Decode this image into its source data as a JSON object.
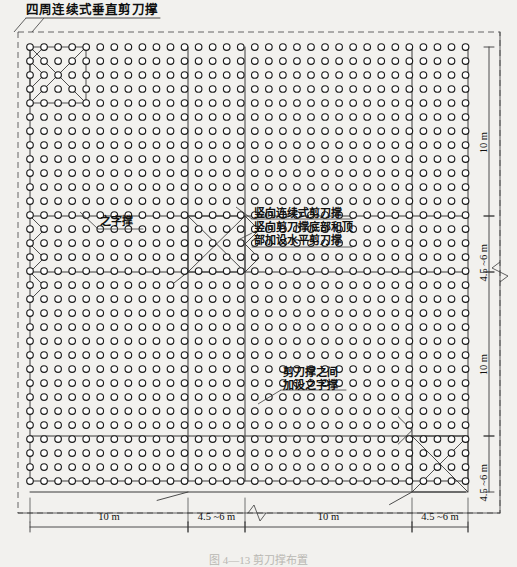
{
  "figure": {
    "title_callout": "四周连续式垂直剪刀撑",
    "caption": "图 4—13  剪刀撑布置",
    "annotations": [
      {
        "name": "zigzag-brace",
        "text": "之字撑"
      },
      {
        "name": "vertical-continuous-brace",
        "text": "竖向连续式剪刀撑"
      },
      {
        "name": "vertical-brace-top-bottom",
        "text": "竖向剪刀撑底部和顶"
      },
      {
        "name": "horizontal-brace-added",
        "text": "部加设水平剪刀撑"
      },
      {
        "name": "between-braces",
        "text": "剪刀撑之间"
      },
      {
        "name": "add-zigzag",
        "text": "加设之字撑"
      }
    ]
  },
  "dimensions": {
    "bottom": [
      {
        "label": "10 m",
        "x0": 30,
        "x1": 188
      },
      {
        "label": "4.5 ~6 m",
        "x0": 188,
        "x1": 245
      },
      {
        "label": "10 m",
        "x0": 245,
        "x1": 412
      },
      {
        "label": "4.5 ~6 m",
        "x0": 412,
        "x1": 468
      }
    ],
    "right": [
      {
        "label": "10 m",
        "y0": 47,
        "y1": 216
      },
      {
        "label": "4.5 ~6 m",
        "y0": 216,
        "y1": 272
      },
      {
        "label": "10 m",
        "y0": 272,
        "y1": 436
      },
      {
        "label": "4.5 ~6 m",
        "y0": 436,
        "y1": 492
      }
    ]
  },
  "chart_data": {
    "type": "diagram",
    "grid": {
      "x_start": 30,
      "y_start": 47,
      "pitch_x": 14.05,
      "pitch_y": 14.0,
      "cols": 32,
      "rows": 32,
      "dot_radius": 3.3
    },
    "bay_lines": {
      "vertical_x": [
        188,
        245,
        412,
        468
      ],
      "horizontal_y": [
        216,
        272,
        436,
        492
      ]
    },
    "border": {
      "x0": 18,
      "y0": 32,
      "x1": 500,
      "y1": 513,
      "style": "dashed"
    },
    "braced_bays": [
      {
        "x0": 188,
        "x1": 245,
        "y0": 216,
        "y1": 272,
        "kind": "x-brace"
      },
      {
        "x0": 412,
        "x1": 468,
        "y0": 436,
        "y1": 492,
        "kind": "x-brace"
      },
      {
        "x0": 30,
        "x1": 86,
        "y0": 47,
        "y1": 103,
        "kind": "x-brace"
      }
    ],
    "units": "m"
  },
  "colors": {
    "ink": "#1a1a1a",
    "line": "#3a3a3a",
    "paper": "#f2f1ee",
    "dashed": "#555555"
  }
}
